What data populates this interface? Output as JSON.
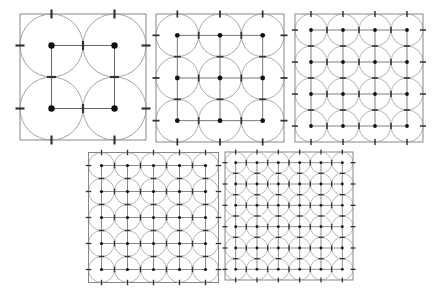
{
  "figure": {
    "title": "",
    "caption": "",
    "background_color": "#ffffff",
    "panel_count": 5
  },
  "style": {
    "circle_stroke": "#9a9a9a",
    "circle_fill": "none",
    "border_stroke": "#7a7a7a",
    "lattice_stroke": "#555555",
    "dot_fill": "#111111",
    "tick_stroke": "#333333"
  },
  "chart_data": {
    "type": "scatter",
    "xlabel": "",
    "ylabel": "",
    "panels": [
      {
        "index": 1,
        "label": "n = 2",
        "grid_n": 2,
        "circle_count": 4,
        "radius_fraction": 0.25,
        "x": 20,
        "y": 14,
        "size": 126,
        "dot_radius": 3.2,
        "tick_length": 9,
        "tick_width": 2.2,
        "circle_stroke_width": 0.9,
        "lattice_stroke_width": 0.9,
        "centers": [
          [
            0.25,
            0.25
          ],
          [
            0.75,
            0.25
          ],
          [
            0.25,
            0.75
          ],
          [
            0.75,
            0.75
          ]
        ]
      },
      {
        "index": 2,
        "label": "n = 3",
        "grid_n": 3,
        "circle_count": 9,
        "radius_fraction": 0.16666,
        "x": 156,
        "y": 14,
        "size": 128,
        "dot_radius": 2.4,
        "tick_length": 7,
        "tick_width": 1.8,
        "circle_stroke_width": 0.85,
        "lattice_stroke_width": 0.8,
        "centers": [
          [
            0.16666,
            0.16666
          ],
          [
            0.5,
            0.16666
          ],
          [
            0.83333,
            0.16666
          ],
          [
            0.16666,
            0.5
          ],
          [
            0.5,
            0.5
          ],
          [
            0.83333,
            0.5
          ],
          [
            0.16666,
            0.83333
          ],
          [
            0.5,
            0.83333
          ],
          [
            0.83333,
            0.83333
          ]
        ]
      },
      {
        "index": 3,
        "label": "n = 4",
        "grid_n": 4,
        "circle_count": 16,
        "radius_fraction": 0.125,
        "x": 295,
        "y": 14,
        "size": 128,
        "dot_radius": 1.9,
        "tick_length": 6,
        "tick_width": 1.5,
        "circle_stroke_width": 0.8,
        "lattice_stroke_width": 0.75,
        "centers": [
          [
            0.125,
            0.125
          ],
          [
            0.375,
            0.125
          ],
          [
            0.625,
            0.125
          ],
          [
            0.875,
            0.125
          ],
          [
            0.125,
            0.375
          ],
          [
            0.375,
            0.375
          ],
          [
            0.625,
            0.375
          ],
          [
            0.875,
            0.375
          ],
          [
            0.125,
            0.625
          ],
          [
            0.375,
            0.625
          ],
          [
            0.625,
            0.625
          ],
          [
            0.875,
            0.625
          ],
          [
            0.125,
            0.875
          ],
          [
            0.375,
            0.875
          ],
          [
            0.625,
            0.875
          ],
          [
            0.875,
            0.875
          ]
        ]
      },
      {
        "index": 4,
        "label": "n = 5",
        "grid_n": 5,
        "circle_count": 25,
        "radius_fraction": 0.1,
        "x": 88,
        "y": 152,
        "size": 130,
        "dot_radius": 1.6,
        "tick_length": 5.5,
        "tick_width": 1.4,
        "circle_stroke_width": 0.75,
        "lattice_stroke_width": 0.7,
        "centers": [
          [
            0.1,
            0.1
          ],
          [
            0.3,
            0.1
          ],
          [
            0.5,
            0.1
          ],
          [
            0.7,
            0.1
          ],
          [
            0.9,
            0.1
          ],
          [
            0.1,
            0.3
          ],
          [
            0.3,
            0.3
          ],
          [
            0.5,
            0.3
          ],
          [
            0.7,
            0.3
          ],
          [
            0.9,
            0.3
          ],
          [
            0.1,
            0.5
          ],
          [
            0.3,
            0.5
          ],
          [
            0.5,
            0.5
          ],
          [
            0.7,
            0.5
          ],
          [
            0.9,
            0.5
          ],
          [
            0.1,
            0.7
          ],
          [
            0.3,
            0.7
          ],
          [
            0.5,
            0.7
          ],
          [
            0.7,
            0.7
          ],
          [
            0.9,
            0.7
          ],
          [
            0.1,
            0.9
          ],
          [
            0.3,
            0.9
          ],
          [
            0.5,
            0.9
          ],
          [
            0.7,
            0.9
          ],
          [
            0.9,
            0.9
          ]
        ]
      },
      {
        "index": 5,
        "label": "n = 6",
        "grid_n": 6,
        "circle_count": 36,
        "radius_fraction": 0.08333,
        "x": 225,
        "y": 152,
        "size": 128,
        "dot_radius": 1.4,
        "tick_length": 5,
        "tick_width": 1.3,
        "circle_stroke_width": 0.7,
        "lattice_stroke_width": 0.65,
        "centers": [
          [
            0.08333,
            0.08333
          ],
          [
            0.25,
            0.08333
          ],
          [
            0.41666,
            0.08333
          ],
          [
            0.58333,
            0.08333
          ],
          [
            0.75,
            0.08333
          ],
          [
            0.91666,
            0.08333
          ],
          [
            0.08333,
            0.25
          ],
          [
            0.25,
            0.25
          ],
          [
            0.41666,
            0.25
          ],
          [
            0.58333,
            0.25
          ],
          [
            0.75,
            0.25
          ],
          [
            0.91666,
            0.25
          ],
          [
            0.08333,
            0.41666
          ],
          [
            0.25,
            0.41666
          ],
          [
            0.41666,
            0.41666
          ],
          [
            0.58333,
            0.41666
          ],
          [
            0.75,
            0.41666
          ],
          [
            0.91666,
            0.41666
          ],
          [
            0.08333,
            0.58333
          ],
          [
            0.25,
            0.58333
          ],
          [
            0.41666,
            0.58333
          ],
          [
            0.58333,
            0.58333
          ],
          [
            0.75,
            0.58333
          ],
          [
            0.91666,
            0.58333
          ],
          [
            0.08333,
            0.75
          ],
          [
            0.25,
            0.75
          ],
          [
            0.41666,
            0.75
          ],
          [
            0.58333,
            0.75
          ],
          [
            0.75,
            0.75
          ],
          [
            0.91666,
            0.75
          ],
          [
            0.08333,
            0.91666
          ],
          [
            0.25,
            0.91666
          ],
          [
            0.41666,
            0.91666
          ],
          [
            0.58333,
            0.91666
          ],
          [
            0.75,
            0.91666
          ],
          [
            0.91666,
            0.91666
          ]
        ]
      }
    ]
  }
}
